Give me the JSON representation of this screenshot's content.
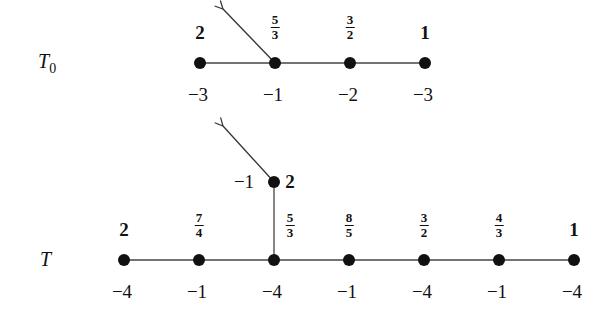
{
  "trees": [
    {
      "name": "T",
      "subscript": "0",
      "nodes": [
        {
          "x": 200,
          "y": 63,
          "top": "2",
          "bottom": "−3"
        },
        {
          "x": 275,
          "y": 63,
          "top_num": "5",
          "top_den": "3",
          "bottom": "−1"
        },
        {
          "x": 350,
          "y": 63,
          "top_num": "3",
          "top_den": "2",
          "bottom": "−2"
        },
        {
          "x": 425,
          "y": 63,
          "top": "1",
          "bottom": "−3"
        }
      ],
      "arrow": {
        "from": [
          275,
          63
        ],
        "to": [
          222,
          8
        ]
      }
    },
    {
      "name": "T",
      "subscript": "",
      "nodes": [
        {
          "x": 124,
          "y": 260,
          "top": "2",
          "bottom": "−4"
        },
        {
          "x": 199,
          "y": 260,
          "top_num": "7",
          "top_den": "4",
          "bottom": "−1"
        },
        {
          "x": 274,
          "y": 260,
          "top_num": "5",
          "top_den": "3",
          "bottom": "−4"
        },
        {
          "x": 349,
          "y": 260,
          "top_num": "8",
          "top_den": "5",
          "bottom": "−1"
        },
        {
          "x": 424,
          "y": 260,
          "top_num": "3",
          "top_den": "2",
          "bottom": "−4"
        },
        {
          "x": 499,
          "y": 260,
          "top_num": "4",
          "top_den": "3",
          "bottom": "−1"
        },
        {
          "x": 574,
          "y": 260,
          "top": "1",
          "bottom": "−4"
        }
      ],
      "branch_node": {
        "x": 274,
        "y": 182,
        "right_label": "2",
        "left_label": "−1"
      },
      "arrow": {
        "from": [
          274,
          182
        ],
        "to": [
          222,
          125
        ]
      }
    }
  ]
}
